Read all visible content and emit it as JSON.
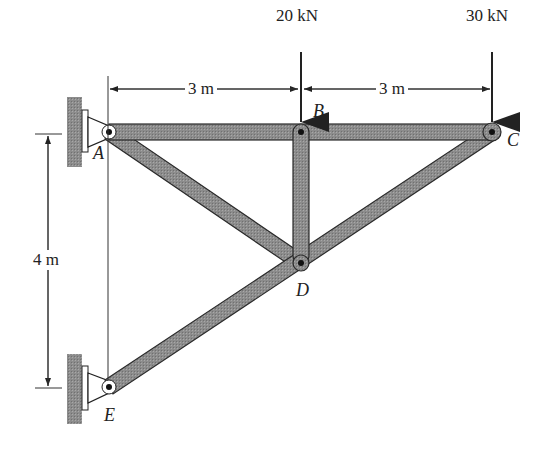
{
  "loads": [
    {
      "label": "20 kN",
      "node": "B"
    },
    {
      "label": "30 kN",
      "node": "C"
    }
  ],
  "dimensions": {
    "horizontal": [
      {
        "label": "3 m",
        "span": "A-B"
      },
      {
        "label": "3 m",
        "span": "B-C"
      }
    ],
    "vertical": {
      "label": "4 m",
      "span": "A-E"
    }
  },
  "nodes": {
    "A": "A",
    "B": "B",
    "C": "C",
    "D": "D",
    "E": "E"
  },
  "members": [
    "AB",
    "BC",
    "AD",
    "BD",
    "CD",
    "DE"
  ],
  "colors": {
    "member_fill": "#8a8a8a",
    "member_stroke": "#2a2a2a",
    "wall": "#9a9a9a",
    "ink": "#222222"
  }
}
